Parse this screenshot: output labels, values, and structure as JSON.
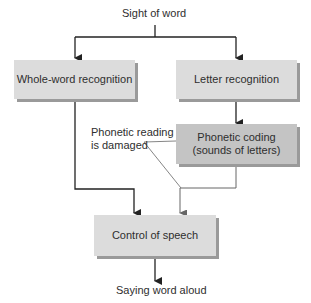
{
  "diagram": {
    "top_label": "Sight of word",
    "bottom_label": "Saying word aloud",
    "nodes": {
      "whole_word": "Whole-word recognition",
      "letter": "Letter recognition",
      "phonetic_line1": "Phonetic coding",
      "phonetic_line2": "(sounds of letters)",
      "control": "Control of speech"
    },
    "annotation": {
      "line1": "Phonetic reading",
      "line2": "is damaged"
    },
    "colors": {
      "box_fill": "#dcdcdc",
      "highlight_box_fill": "#c4c4c4",
      "shadow": "#9a9a9a",
      "line": "#333333",
      "annotation_line": "#777777"
    }
  }
}
